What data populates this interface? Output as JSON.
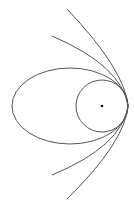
{
  "diagram": {
    "kind": "conic sections sharing a common vertex",
    "background": "#ffffff",
    "stroke_color": "#444444",
    "dot_color": "#111111",
    "vertex": {
      "x": 128,
      "y": 106
    },
    "shapes": [
      {
        "name": "circle",
        "cx": 102,
        "cy": 106,
        "r": 26
      },
      {
        "name": "ellipse",
        "cx": 70,
        "cy": 106,
        "rx": 58,
        "ry": 38
      },
      {
        "name": "parabola-inner",
        "start": [
          52,
          36
        ],
        "end": [
          52,
          175
        ]
      },
      {
        "name": "hyperbola-outer",
        "start": [
          67,
          9
        ],
        "end": [
          67,
          199
        ]
      }
    ],
    "focus_dot": {
      "cx": 102,
      "cy": 106,
      "r": 1.3
    }
  }
}
